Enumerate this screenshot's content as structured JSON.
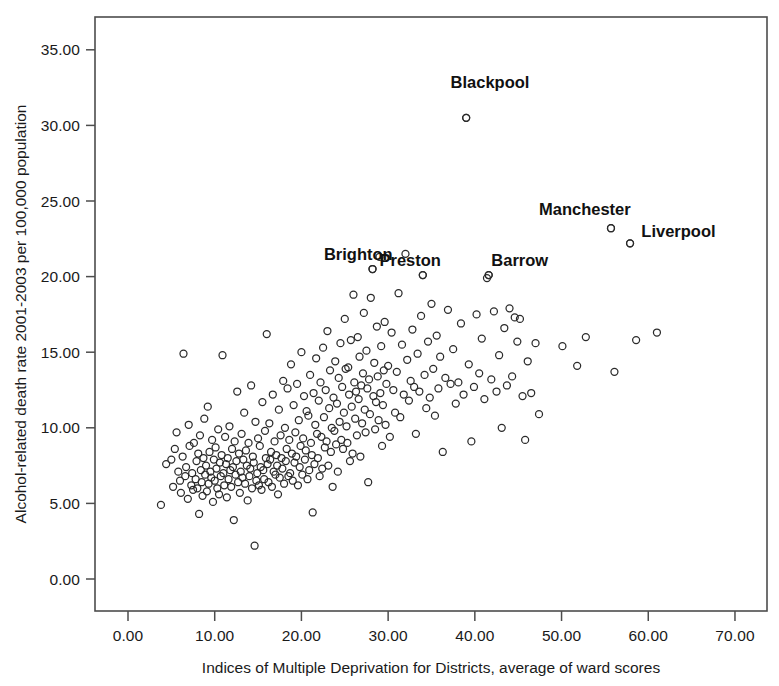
{
  "chart_data": {
    "type": "scatter",
    "title": "",
    "xlabel": "Indices of Multiple Deprivation for Districts, average of ward scores",
    "ylabel": "Alcohol-related death rate 2001-2003 per 100,000 population",
    "xlim": [
      -2.0,
      73.5
    ],
    "ylim": [
      -1.6,
      36.7
    ],
    "xticks": [
      0,
      10,
      20,
      30,
      40,
      50,
      60,
      70
    ],
    "xtick_labels": [
      "0.00",
      "10.00",
      "20.00",
      "30.00",
      "40.00",
      "50.00",
      "60.00",
      "70.00"
    ],
    "yticks": [
      0,
      5,
      10,
      15,
      20,
      25,
      30,
      35
    ],
    "ytick_labels": [
      "0.00",
      "5.00",
      "10.00",
      "15.00",
      "20.00",
      "25.00",
      "30.00",
      "35.00"
    ],
    "grid": false,
    "legend": false,
    "marker": "open-circle",
    "marker_color": "#2b2b2b",
    "marker_size": 7,
    "annotations": [
      {
        "label": "Blackpool",
        "x": 39.0,
        "y": 30.5,
        "label_dx": -1.8,
        "label_dy": 2.0
      },
      {
        "label": "Brighton",
        "x": 28.2,
        "y": 20.5,
        "label_dx": -5.6,
        "label_dy": 0.6
      },
      {
        "label": "Preston",
        "x": 34.0,
        "y": 20.1,
        "label_dx": -5.0,
        "label_dy": 0.6
      },
      {
        "label": "Barrow",
        "x": 41.6,
        "y": 20.1,
        "label_dx": 0.3,
        "label_dy": 0.6
      },
      {
        "label": "Manchester",
        "x": 55.7,
        "y": 23.2,
        "label_dx": -8.3,
        "label_dy": 0.9
      },
      {
        "label": "Liverpool",
        "x": 57.9,
        "y": 22.2,
        "label_dx": 1.3,
        "label_dy": 0.4
      }
    ],
    "points": [
      [
        3.8,
        4.9
      ],
      [
        4.4,
        7.6
      ],
      [
        5.0,
        7.9
      ],
      [
        5.2,
        6.1
      ],
      [
        5.4,
        8.6
      ],
      [
        5.6,
        9.7
      ],
      [
        5.8,
        7.1
      ],
      [
        6.0,
        6.5
      ],
      [
        6.1,
        5.7
      ],
      [
        6.3,
        8.1
      ],
      [
        6.4,
        14.9
      ],
      [
        6.6,
        6.8
      ],
      [
        6.7,
        7.4
      ],
      [
        6.9,
        5.3
      ],
      [
        7.0,
        10.2
      ],
      [
        7.1,
        8.8
      ],
      [
        7.3,
        6.2
      ],
      [
        7.4,
        7.0
      ],
      [
        7.5,
        5.9
      ],
      [
        7.6,
        9.0
      ],
      [
        7.8,
        6.6
      ],
      [
        7.9,
        7.8
      ],
      [
        8.0,
        6.0
      ],
      [
        8.1,
        8.3
      ],
      [
        8.2,
        4.3
      ],
      [
        8.3,
        9.5
      ],
      [
        8.4,
        7.2
      ],
      [
        8.5,
        6.4
      ],
      [
        8.6,
        5.5
      ],
      [
        8.7,
        8.0
      ],
      [
        8.8,
        10.6
      ],
      [
        8.9,
        6.9
      ],
      [
        9.0,
        7.5
      ],
      [
        9.1,
        5.8
      ],
      [
        9.2,
        11.4
      ],
      [
        9.3,
        6.3
      ],
      [
        9.4,
        8.4
      ],
      [
        9.5,
        7.1
      ],
      [
        9.6,
        6.7
      ],
      [
        9.7,
        9.2
      ],
      [
        9.8,
        5.1
      ],
      [
        9.9,
        7.9
      ],
      [
        10.0,
        6.5
      ],
      [
        10.1,
        8.7
      ],
      [
        10.2,
        7.3
      ],
      [
        10.3,
        6.0
      ],
      [
        10.4,
        9.9
      ],
      [
        10.5,
        5.6
      ],
      [
        10.6,
        7.7
      ],
      [
        10.7,
        6.8
      ],
      [
        10.8,
        8.2
      ],
      [
        10.9,
        14.8
      ],
      [
        11.0,
        7.0
      ],
      [
        11.1,
        6.2
      ],
      [
        11.2,
        9.4
      ],
      [
        11.3,
        7.6
      ],
      [
        11.4,
        5.4
      ],
      [
        11.5,
        8.0
      ],
      [
        11.6,
        6.6
      ],
      [
        11.7,
        10.1
      ],
      [
        11.8,
        7.2
      ],
      [
        11.9,
        6.1
      ],
      [
        12.0,
        8.6
      ],
      [
        12.1,
        7.4
      ],
      [
        12.2,
        3.9
      ],
      [
        12.3,
        9.1
      ],
      [
        12.4,
        6.9
      ],
      [
        12.5,
        7.8
      ],
      [
        12.6,
        12.4
      ],
      [
        12.7,
        6.4
      ],
      [
        12.8,
        8.3
      ],
      [
        12.9,
        5.7
      ],
      [
        13.0,
        7.1
      ],
      [
        13.1,
        9.6
      ],
      [
        13.2,
        6.7
      ],
      [
        13.3,
        7.9
      ],
      [
        13.4,
        11.0
      ],
      [
        13.5,
        6.3
      ],
      [
        13.6,
        8.5
      ],
      [
        13.7,
        7.5
      ],
      [
        13.8,
        5.2
      ],
      [
        13.9,
        9.0
      ],
      [
        14.0,
        6.8
      ],
      [
        14.1,
        7.3
      ],
      [
        14.2,
        12.8
      ],
      [
        14.3,
        6.0
      ],
      [
        14.4,
        8.1
      ],
      [
        14.5,
        7.7
      ],
      [
        14.6,
        2.2
      ],
      [
        14.7,
        10.4
      ],
      [
        14.8,
        6.5
      ],
      [
        14.9,
        7.0
      ],
      [
        15.0,
        9.3
      ],
      [
        15.1,
        6.2
      ],
      [
        15.2,
        8.8
      ],
      [
        15.3,
        7.4
      ],
      [
        15.4,
        5.9
      ],
      [
        15.5,
        11.7
      ],
      [
        15.6,
        7.2
      ],
      [
        15.7,
        6.6
      ],
      [
        15.8,
        9.8
      ],
      [
        15.9,
        8.0
      ],
      [
        16.0,
        16.2
      ],
      [
        16.1,
        7.6
      ],
      [
        16.2,
        6.4
      ],
      [
        16.3,
        10.3
      ],
      [
        16.4,
        7.9
      ],
      [
        16.5,
        8.4
      ],
      [
        16.6,
        6.1
      ],
      [
        16.7,
        12.2
      ],
      [
        16.8,
        7.1
      ],
      [
        16.9,
        9.1
      ],
      [
        17.0,
        6.9
      ],
      [
        17.1,
        8.2
      ],
      [
        17.2,
        7.5
      ],
      [
        17.3,
        5.6
      ],
      [
        17.4,
        11.2
      ],
      [
        17.5,
        6.7
      ],
      [
        17.6,
        9.5
      ],
      [
        17.7,
        8.0
      ],
      [
        17.8,
        7.3
      ],
      [
        17.9,
        13.1
      ],
      [
        18.0,
        6.3
      ],
      [
        18.1,
        10.0
      ],
      [
        18.2,
        7.8
      ],
      [
        18.3,
        8.6
      ],
      [
        18.4,
        12.6
      ],
      [
        18.5,
        6.8
      ],
      [
        18.6,
        9.2
      ],
      [
        18.7,
        7.0
      ],
      [
        18.8,
        14.2
      ],
      [
        18.9,
        8.3
      ],
      [
        19.0,
        6.5
      ],
      [
        19.1,
        11.5
      ],
      [
        19.2,
        7.7
      ],
      [
        19.3,
        9.7
      ],
      [
        19.4,
        8.1
      ],
      [
        19.5,
        12.9
      ],
      [
        19.6,
        6.2
      ],
      [
        19.7,
        10.5
      ],
      [
        19.8,
        7.4
      ],
      [
        19.9,
        8.8
      ],
      [
        20.0,
        15.0
      ],
      [
        20.1,
        6.9
      ],
      [
        20.2,
        9.3
      ],
      [
        20.3,
        12.1
      ],
      [
        20.4,
        7.9
      ],
      [
        20.5,
        8.5
      ],
      [
        20.6,
        11.1
      ],
      [
        20.7,
        6.6
      ],
      [
        20.8,
        10.8
      ],
      [
        20.9,
        7.2
      ],
      [
        21.0,
        13.5
      ],
      [
        21.1,
        9.0
      ],
      [
        21.2,
        8.2
      ],
      [
        21.3,
        4.4
      ],
      [
        21.4,
        12.3
      ],
      [
        21.5,
        7.6
      ],
      [
        21.6,
        10.2
      ],
      [
        21.7,
        14.6
      ],
      [
        21.8,
        9.6
      ],
      [
        21.9,
        8.0
      ],
      [
        22.0,
        11.8
      ],
      [
        22.1,
        6.8
      ],
      [
        22.2,
        13.0
      ],
      [
        22.3,
        9.4
      ],
      [
        22.4,
        7.3
      ],
      [
        22.5,
        15.3
      ],
      [
        22.6,
        10.7
      ],
      [
        22.7,
        8.7
      ],
      [
        22.8,
        12.5
      ],
      [
        22.9,
        9.1
      ],
      [
        23.0,
        16.4
      ],
      [
        23.1,
        7.5
      ],
      [
        23.2,
        11.3
      ],
      [
        23.3,
        13.8
      ],
      [
        23.4,
        8.4
      ],
      [
        23.5,
        10.0
      ],
      [
        23.6,
        6.1
      ],
      [
        23.7,
        12.0
      ],
      [
        23.8,
        9.8
      ],
      [
        23.9,
        14.4
      ],
      [
        24.0,
        8.9
      ],
      [
        24.1,
        11.6
      ],
      [
        24.2,
        7.1
      ],
      [
        24.3,
        13.3
      ],
      [
        24.4,
        10.4
      ],
      [
        24.5,
        15.6
      ],
      [
        24.6,
        9.2
      ],
      [
        24.7,
        12.7
      ],
      [
        24.8,
        8.6
      ],
      [
        24.9,
        11.0
      ],
      [
        25.0,
        17.2
      ],
      [
        25.1,
        13.9
      ],
      [
        25.2,
        10.1
      ],
      [
        25.3,
        9.0
      ],
      [
        25.4,
        14.0
      ],
      [
        25.5,
        12.2
      ],
      [
        25.6,
        7.8
      ],
      [
        25.7,
        15.8
      ],
      [
        25.8,
        11.4
      ],
      [
        25.9,
        8.3
      ],
      [
        26.0,
        18.8
      ],
      [
        26.1,
        13.0
      ],
      [
        26.2,
        10.6
      ],
      [
        26.3,
        12.4
      ],
      [
        26.4,
        9.5
      ],
      [
        26.5,
        16.0
      ],
      [
        26.6,
        11.9
      ],
      [
        26.7,
        14.7
      ],
      [
        26.8,
        8.1
      ],
      [
        26.9,
        12.8
      ],
      [
        27.0,
        10.3
      ],
      [
        27.1,
        13.6
      ],
      [
        27.2,
        17.6
      ],
      [
        27.3,
        11.2
      ],
      [
        27.4,
        9.7
      ],
      [
        27.5,
        15.1
      ],
      [
        27.6,
        12.6
      ],
      [
        27.7,
        6.4
      ],
      [
        27.8,
        13.2
      ],
      [
        27.9,
        10.9
      ],
      [
        28.0,
        18.6
      ],
      [
        28.2,
        20.5
      ],
      [
        28.3,
        12.1
      ],
      [
        28.4,
        14.3
      ],
      [
        28.5,
        9.9
      ],
      [
        28.6,
        11.7
      ],
      [
        28.7,
        16.7
      ],
      [
        28.8,
        13.4
      ],
      [
        28.9,
        10.5
      ],
      [
        29.0,
        21.3
      ],
      [
        29.1,
        12.3
      ],
      [
        29.2,
        15.4
      ],
      [
        29.3,
        8.8
      ],
      [
        29.4,
        11.5
      ],
      [
        29.5,
        13.8
      ],
      [
        29.6,
        17.0
      ],
      [
        29.7,
        10.2
      ],
      [
        29.8,
        12.9
      ],
      [
        30.0,
        14.1
      ],
      [
        30.2,
        9.4
      ],
      [
        30.4,
        16.3
      ],
      [
        30.6,
        12.5
      ],
      [
        30.8,
        11.0
      ],
      [
        31.0,
        13.7
      ],
      [
        31.2,
        18.9
      ],
      [
        31.4,
        10.7
      ],
      [
        31.6,
        15.5
      ],
      [
        31.8,
        12.2
      ],
      [
        32.0,
        21.5
      ],
      [
        32.2,
        14.5
      ],
      [
        32.4,
        11.8
      ],
      [
        32.6,
        13.1
      ],
      [
        32.8,
        16.5
      ],
      [
        33.0,
        12.7
      ],
      [
        33.2,
        9.6
      ],
      [
        33.4,
        14.9
      ],
      [
        33.6,
        12.4
      ],
      [
        33.8,
        17.4
      ],
      [
        34.0,
        20.1
      ],
      [
        34.2,
        13.5
      ],
      [
        34.4,
        11.3
      ],
      [
        34.6,
        15.7
      ],
      [
        34.8,
        12.0
      ],
      [
        35.0,
        18.2
      ],
      [
        35.2,
        13.9
      ],
      [
        35.4,
        10.8
      ],
      [
        35.6,
        16.1
      ],
      [
        35.8,
        12.6
      ],
      [
        36.0,
        14.7
      ],
      [
        36.3,
        8.4
      ],
      [
        36.6,
        13.3
      ],
      [
        36.9,
        17.8
      ],
      [
        37.2,
        12.9
      ],
      [
        37.5,
        15.2
      ],
      [
        37.8,
        11.6
      ],
      [
        38.1,
        13.0
      ],
      [
        38.4,
        16.9
      ],
      [
        38.7,
        12.2
      ],
      [
        39.0,
        30.5
      ],
      [
        39.3,
        14.2
      ],
      [
        39.6,
        9.1
      ],
      [
        39.9,
        12.7
      ],
      [
        40.2,
        17.5
      ],
      [
        40.5,
        13.6
      ],
      [
        40.8,
        15.9
      ],
      [
        41.1,
        11.9
      ],
      [
        41.4,
        19.9
      ],
      [
        41.6,
        20.1
      ],
      [
        41.9,
        13.2
      ],
      [
        42.2,
        17.7
      ],
      [
        42.5,
        12.4
      ],
      [
        42.8,
        14.8
      ],
      [
        43.1,
        10.0
      ],
      [
        43.4,
        16.6
      ],
      [
        43.7,
        12.8
      ],
      [
        44.0,
        17.9
      ],
      [
        44.3,
        13.4
      ],
      [
        44.6,
        17.3
      ],
      [
        44.9,
        15.7
      ],
      [
        45.2,
        17.2
      ],
      [
        45.5,
        12.1
      ],
      [
        45.8,
        9.2
      ],
      [
        46.1,
        14.4
      ],
      [
        46.5,
        12.3
      ],
      [
        47.0,
        15.6
      ],
      [
        47.4,
        10.9
      ],
      [
        50.1,
        15.4
      ],
      [
        51.8,
        14.1
      ],
      [
        52.8,
        16.0
      ],
      [
        55.7,
        23.2
      ],
      [
        56.1,
        13.7
      ],
      [
        57.9,
        22.2
      ],
      [
        58.6,
        15.8
      ],
      [
        61.0,
        16.3
      ]
    ]
  }
}
